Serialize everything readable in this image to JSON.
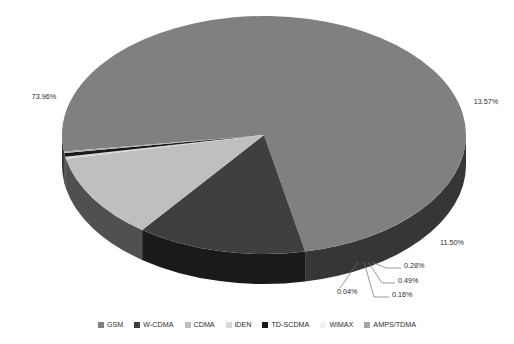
{
  "chart_data": {
    "type": "pie",
    "title": "",
    "subtitle": "",
    "xlabel": "",
    "ylabel": "",
    "three_d": true,
    "grid": false,
    "legend_position": "bottom",
    "value_suffix": "%",
    "categories": [
      "GSM",
      "W-CDMA",
      "CDMA",
      "iDEN",
      "TD-SCDMA",
      "WiMAX",
      "AMPS/TDMA"
    ],
    "values": [
      73.96,
      13.57,
      11.5,
      0.28,
      0.49,
      0.04,
      0.16
    ],
    "labels": [
      "73.96%",
      "13.57%",
      "11.50%",
      "0.28%",
      "0.49%",
      "0.04%",
      "0.16%"
    ],
    "colors": [
      "#808080",
      "#3f3f3f",
      "#bfbfbf",
      "#d9d9d9",
      "#1a1a1a",
      "#f2f2f2",
      "#a6a6a6"
    ],
    "slices": [
      {
        "name": "GSM",
        "value": 73.96,
        "label": "73.96%",
        "color": "#808080"
      },
      {
        "name": "W-CDMA",
        "value": 13.57,
        "label": "13.57%",
        "color": "#3f3f3f"
      },
      {
        "name": "CDMA",
        "value": 11.5,
        "label": "11.50%",
        "color": "#bfbfbf"
      },
      {
        "name": "iDEN",
        "value": 0.28,
        "label": "0.28%",
        "color": "#d9d9d9"
      },
      {
        "name": "TD-SCDMA",
        "value": 0.49,
        "label": "0.49%",
        "color": "#1a1a1a"
      },
      {
        "name": "WiMAX",
        "value": 0.04,
        "label": "0.04%",
        "color": "#f2f2f2"
      },
      {
        "name": "AMPS/TDMA",
        "value": 0.16,
        "label": "0.16%",
        "color": "#a6a6a6"
      }
    ]
  },
  "legend": {
    "items": [
      {
        "label": "GSM",
        "color": "#808080"
      },
      {
        "label": "W-CDMA",
        "color": "#3f3f3f"
      },
      {
        "label": "CDMA",
        "color": "#bfbfbf"
      },
      {
        "label": "iDEN",
        "color": "#d9d9d9"
      },
      {
        "label": "TD-SCDMA",
        "color": "#1a1a1a"
      },
      {
        "label": "WiMAX",
        "color": "#f2f2f2"
      },
      {
        "label": "AMPS/TDMA",
        "color": "#a6a6a6"
      }
    ]
  },
  "callouts": [
    {
      "label": "73.96%",
      "x": 44,
      "y": 99,
      "anchor": "middle"
    },
    {
      "label": "13.57%",
      "x": 486,
      "y": 104,
      "anchor": "middle"
    },
    {
      "label": "11.50%",
      "x": 452,
      "y": 245,
      "anchor": "middle"
    },
    {
      "label": "0.28%",
      "x": 404,
      "y": 268,
      "anchor": "start"
    },
    {
      "label": "0.49%",
      "x": 398,
      "y": 283,
      "anchor": "start"
    },
    {
      "label": "0.16%",
      "x": 392,
      "y": 297,
      "anchor": "start"
    },
    {
      "label": "0.04%",
      "x": 337,
      "y": 294,
      "anchor": "start"
    }
  ]
}
